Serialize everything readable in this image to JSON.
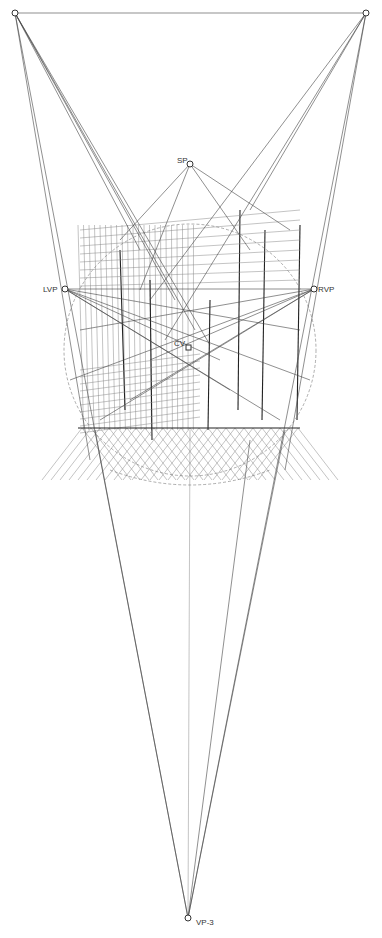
{
  "diagram": {
    "colors": {
      "line": "#444444",
      "dark_line": "#222222",
      "light_line": "#888888",
      "background": "#ffffff"
    },
    "points": [
      {
        "id": "top-left",
        "label": ""
      },
      {
        "id": "top-right",
        "label": ""
      },
      {
        "id": "sp",
        "label": "SP"
      },
      {
        "id": "lvp",
        "label": "LVP"
      },
      {
        "id": "rvp",
        "label": "RVP"
      },
      {
        "id": "cv",
        "label": "CV"
      },
      {
        "id": "vp3",
        "label": "VP-3"
      }
    ]
  }
}
